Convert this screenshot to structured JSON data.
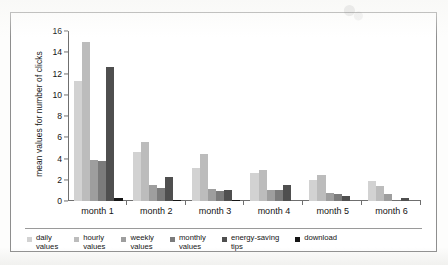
{
  "chart_data": {
    "type": "bar",
    "title": "",
    "xlabel": "",
    "ylabel": "mean values for number of clicks",
    "ylim": [
      0,
      16
    ],
    "yticks": [
      0,
      2,
      4,
      6,
      8,
      10,
      12,
      14,
      16
    ],
    "grid": false,
    "legend_position": "bottom",
    "categories": [
      "month 1",
      "month 2",
      "month 3",
      "month 4",
      "month 5",
      "month 6"
    ],
    "series": [
      {
        "name": "daily\nvalues",
        "color": "#d2d2d2",
        "values": [
          11.3,
          4.65,
          3.15,
          2.65,
          1.95,
          1.9
        ]
      },
      {
        "name": "hourly\nvalues",
        "color": "#bcbcbc",
        "values": [
          15.0,
          5.55,
          4.4,
          2.95,
          2.45,
          1.4
        ]
      },
      {
        "name": "weekly\nvalues",
        "color": "#9e9e9e",
        "values": [
          3.9,
          1.5,
          1.1,
          1.05,
          0.8,
          0.7
        ]
      },
      {
        "name": "monthly\nvalues",
        "color": "#7b7b7b",
        "values": [
          3.8,
          1.25,
          0.9,
          1.05,
          0.65,
          0.0
        ]
      },
      {
        "name": "energy-saving\ntips",
        "color": "#4f4f4f",
        "values": [
          12.6,
          2.3,
          1.0,
          1.5,
          0.45,
          0.3
        ]
      },
      {
        "name": "download",
        "color": "#151515",
        "values": [
          0.3,
          0.1,
          0.05,
          0.0,
          0.0,
          0.0
        ]
      }
    ]
  },
  "legend": {
    "items": [
      {
        "label": "daily\nvalues"
      },
      {
        "label": "hourly\nvalues"
      },
      {
        "label": "weekly\nvalues"
      },
      {
        "label": "monthly\nvalues"
      },
      {
        "label": "energy-saving\ntips"
      },
      {
        "label": "download"
      }
    ]
  }
}
